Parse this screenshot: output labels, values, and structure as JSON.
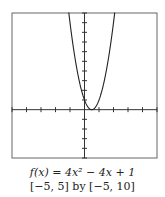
{
  "chart_data": {
    "type": "line",
    "title": "",
    "function_label": "f(x) = 4x² − 4x + 1",
    "window_label": "[−5, 5] by [−5, 10]",
    "xlabel": "",
    "ylabel": "",
    "xlim": [
      -5,
      5
    ],
    "ylim": [
      -5,
      10
    ],
    "xtick_step": 1,
    "ytick_step": 1,
    "grid": false,
    "legend": "none",
    "series": [
      {
        "name": "f(x) = 4x^2 - 4x + 1",
        "x": [
          -1.1,
          -1.0,
          -0.75,
          -0.5,
          -0.25,
          0,
          0.25,
          0.5,
          0.75,
          1.0,
          1.25,
          1.5,
          1.75,
          2.0,
          2.1
        ],
        "values": [
          10.24,
          9,
          6.25,
          4,
          2.25,
          1,
          0.25,
          0,
          0.25,
          1,
          2.25,
          4,
          6.25,
          9,
          10.24
        ]
      }
    ],
    "colors": {
      "curve": "#222222",
      "axes": "#333333",
      "frame": "#555555"
    }
  },
  "captions": {
    "line1": "f(x) = 4x² − 4x + 1",
    "line2": "[−5, 5] by [−5, 10]"
  }
}
